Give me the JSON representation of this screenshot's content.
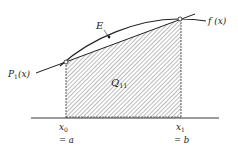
{
  "diagram": {
    "curve_label": "f (x)",
    "chord_label_main": "P",
    "chord_label_sub": "1",
    "chord_label_arg": "(x)",
    "error_label": "E",
    "area_label_main": "Q",
    "area_label_sub": "11",
    "x0_label_main": "x",
    "x0_label_sub": "0",
    "x0_eq": "= a",
    "x1_label_main": "x",
    "x1_label_sub": "1",
    "x1_eq": "= b",
    "colors": {
      "line": "#222222",
      "hatch": "#444444",
      "background": "#ffffff"
    }
  }
}
